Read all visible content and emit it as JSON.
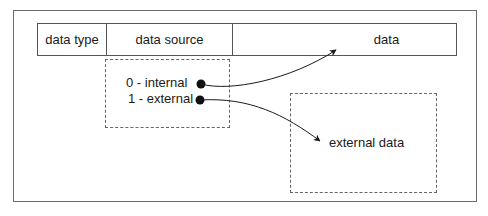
{
  "diagram": {
    "header": {
      "columns": [
        {
          "label": "data type"
        },
        {
          "label": "data source"
        },
        {
          "label": "data"
        }
      ]
    },
    "source_box": {
      "options": [
        {
          "label": "0 - internal"
        },
        {
          "label": "1 - external"
        }
      ]
    },
    "external_box": {
      "label": "external data"
    },
    "edges": [
      {
        "from": "0 - internal",
        "to": "data"
      },
      {
        "from": "1 - external",
        "to": "external data"
      }
    ],
    "colors": {
      "line": "#1a1a1a",
      "border": "#555555",
      "dashed": "#666666"
    }
  }
}
